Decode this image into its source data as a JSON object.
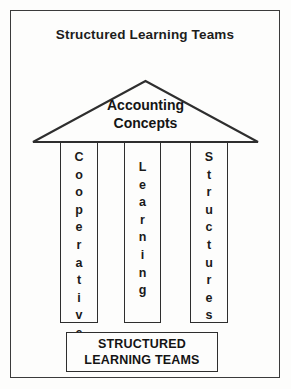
{
  "figure": {
    "title": "Structured Learning Teams",
    "frame_color": "#3b3b3b",
    "background_color": "#fdfdfc",
    "ink_color": "#1a1a1a"
  },
  "roof": {
    "icon": "triangle-roof-icon",
    "label_line_1": "Accounting",
    "label_line_2": "Concepts"
  },
  "pillars": [
    {
      "name": "cooperative",
      "text": "Cooperative",
      "letters": [
        "C",
        "o",
        "o",
        "p",
        "e",
        "r",
        "a",
        "t",
        "i",
        "v",
        "e"
      ]
    },
    {
      "name": "learning",
      "text": "Learning",
      "letters": [
        "L",
        "e",
        "a",
        "r",
        "n",
        "i",
        "n",
        "g"
      ]
    },
    {
      "name": "structures",
      "text": "Structures",
      "letters": [
        "S",
        "t",
        "r",
        "u",
        "c",
        "t",
        "u",
        "r",
        "e",
        "s"
      ]
    }
  ],
  "base": {
    "line_1": "STRUCTURED",
    "line_2": "LEARNING TEAMS"
  }
}
